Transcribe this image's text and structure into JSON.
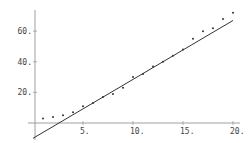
{
  "chart_data": {
    "type": "scatter",
    "title": "",
    "xlabel": "",
    "ylabel": "",
    "xlim": [
      0,
      20.5
    ],
    "ylim": [
      -12,
      75
    ],
    "grid": false,
    "legend": null,
    "x_ticks": [
      "5.",
      "10.",
      "15.",
      "20."
    ],
    "y_ticks": [
      "20.",
      "40.",
      "60."
    ],
    "series": [
      {
        "name": "data",
        "kind": "points",
        "x": [
          1,
          2,
          3,
          4,
          5,
          6,
          7,
          8,
          9,
          10,
          11,
          12,
          13,
          14,
          15,
          16,
          17,
          18,
          19,
          20
        ],
        "y": [
          3,
          4,
          5,
          7,
          11,
          13,
          17,
          19,
          23,
          30,
          32,
          37,
          40,
          44,
          48,
          55,
          60,
          62,
          68,
          72
        ]
      },
      {
        "name": "fit",
        "kind": "line",
        "x": [
          0,
          20
        ],
        "y": [
          -10,
          67
        ]
      }
    ]
  },
  "colors": {
    "ink": "#333333",
    "axis": "#888888",
    "text": "#444444"
  }
}
